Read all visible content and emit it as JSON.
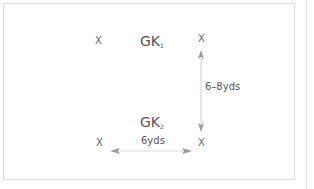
{
  "diagram": {
    "markers": [
      {
        "id": "cone-top-left",
        "label": "X"
      },
      {
        "id": "cone-top-right",
        "label": "X"
      },
      {
        "id": "cone-bottom-left",
        "label": "X"
      },
      {
        "id": "cone-bottom-right",
        "label": "X"
      }
    ],
    "goalkeepers": [
      {
        "id": "gk1",
        "label": "GK",
        "subscript": "1"
      },
      {
        "id": "gk2",
        "label": "GK",
        "subscript": "2"
      }
    ],
    "distances": {
      "vertical": "6–8yds",
      "horizontal": "6yds"
    },
    "colors": {
      "arrow": "#999999",
      "border": "#dcdcdc",
      "text": "#555555"
    }
  }
}
